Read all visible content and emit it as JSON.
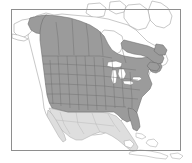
{
  "figure": {
    "type": "distribution-range-map",
    "region": "North America",
    "caption": "",
    "title": "",
    "background_color": "#ffffff"
  },
  "frame": {
    "name": "map-border",
    "x": 11,
    "y": 9,
    "width": 169,
    "height": 141,
    "stroke_color": "#8e8e8e",
    "stroke_width": 1
  },
  "legend_colors": {
    "range_shaded": "#9b9b9b",
    "range_outline": "#6a6a6a",
    "non_range_land": "#ffffff",
    "secondary_land": "#dedede",
    "coastline": "#9a9a9a",
    "lake_water": "#ffffff",
    "subdivision_border": "#6e6e6e"
  },
  "layers": [
    {
      "name": "coastline-base",
      "label": "North America coastline",
      "fill": "#ffffff",
      "stroke": "#9a9a9a"
    },
    {
      "name": "secondary-land",
      "label": "Mexico and Central America",
      "fill": "#dedede",
      "stroke": "#a6a6a6"
    },
    {
      "name": "species-range",
      "label": "Shaded distribution range",
      "fill": "#9b9b9b",
      "stroke": "#6a6a6a"
    },
    {
      "name": "great-lakes",
      "label": "Great Lakes",
      "fill": "#ffffff",
      "stroke": "#7d7d7d"
    },
    {
      "name": "subdivisions",
      "label": "State and province borders",
      "fill": "none",
      "stroke": "#6e6e6e"
    },
    {
      "name": "caribbean-islands",
      "label": "Caribbean islands",
      "fill": "#ffffff",
      "stroke": "#a2a2a2"
    }
  ],
  "chart_data": {
    "type": "map",
    "title": "",
    "xlabel": "",
    "ylabel": "",
    "projection": "conic",
    "extent_description": "North America from Alaska and Arctic Canada south to Mexico and the Caribbean",
    "categories": [
      "Shaded range (dark gray)",
      "Outside range (white)",
      "Secondary land (light gray)"
    ],
    "values": [
      "Most of the contiguous United States and southern Canada including British Columbia, Alberta, Saskatchewan, Manitoba, Ontario, Quebec and the Maritimes",
      "Arctic Canada, Hudson Bay region, northern Quebec, Greenland, Great Lakes water",
      "Mexico, Baja California and northern Central America"
    ],
    "legend_position": "none",
    "grid": false
  }
}
